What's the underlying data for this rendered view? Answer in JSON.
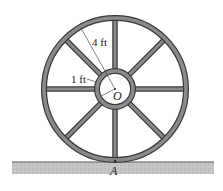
{
  "diagram": {
    "type": "mechanics-figure",
    "labels": {
      "outer_radius": "4 ft",
      "hub_radius": "1 ft",
      "center": "O",
      "contact_point": "A"
    },
    "spoke_count": 8,
    "colors": {
      "rim": "#6e6e6e",
      "rim_edge": "#3a3a3a",
      "ground": "#bdbdbd",
      "text": "#222222"
    }
  }
}
